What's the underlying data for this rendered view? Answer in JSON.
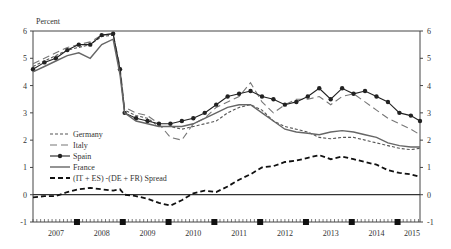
{
  "chart_data": {
    "type": "line",
    "title": "",
    "ylabel": "Percent",
    "xlabel": "",
    "ylim": [
      -1,
      6
    ],
    "yticks": [
      -1,
      0,
      1,
      2,
      3,
      4,
      5,
      6
    ],
    "xlim": [
      2007.0,
      2015.45
    ],
    "xtick_labels": [
      "2007",
      "2008",
      "2009",
      "2010",
      "2011",
      "2012",
      "2013",
      "2014",
      "2015"
    ],
    "year_end_markers": [
      2007.96,
      2008.96,
      2009.96,
      2010.96,
      2011.96,
      2012.96,
      2013.96,
      2014.96
    ],
    "grid": false,
    "legend_position": "left-middle",
    "x": [
      2007.0,
      2007.25,
      2007.5,
      2007.75,
      2008.0,
      2008.25,
      2008.5,
      2008.75,
      2008.9,
      2009.0,
      2009.25,
      2009.5,
      2009.75,
      2010.0,
      2010.25,
      2010.5,
      2010.75,
      2011.0,
      2011.25,
      2011.5,
      2011.75,
      2012.0,
      2012.25,
      2012.5,
      2012.75,
      2013.0,
      2013.25,
      2013.5,
      2013.75,
      2014.0,
      2014.25,
      2014.5,
      2014.75,
      2015.0,
      2015.25,
      2015.45
    ],
    "series": [
      {
        "name": "Germany",
        "style": "short-dash",
        "color": "#555555",
        "values": [
          4.7,
          4.9,
          5.1,
          5.3,
          5.4,
          5.5,
          5.8,
          5.85,
          4.5,
          3.1,
          2.9,
          2.8,
          2.5,
          2.5,
          2.4,
          2.5,
          2.6,
          2.7,
          3.0,
          3.2,
          3.3,
          3.1,
          2.7,
          2.5,
          2.4,
          2.3,
          2.1,
          2.05,
          2.1,
          2.1,
          2.0,
          1.9,
          1.8,
          1.7,
          1.65,
          1.7
        ]
      },
      {
        "name": "Italy",
        "style": "long-dash",
        "color": "#777777",
        "values": [
          4.8,
          5.0,
          5.2,
          5.4,
          5.5,
          5.6,
          5.85,
          5.9,
          4.7,
          3.2,
          3.0,
          2.9,
          2.6,
          2.1,
          2.0,
          2.6,
          2.8,
          3.2,
          3.4,
          3.6,
          4.1,
          3.4,
          3.0,
          3.3,
          3.5,
          3.5,
          3.6,
          3.3,
          3.6,
          3.7,
          3.4,
          3.1,
          2.8,
          2.6,
          2.4,
          2.2
        ]
      },
      {
        "name": "Spain",
        "style": "line-dot",
        "color": "#222222",
        "values": [
          4.6,
          4.85,
          5.0,
          5.3,
          5.5,
          5.5,
          5.85,
          5.9,
          4.6,
          3.0,
          2.8,
          2.7,
          2.6,
          2.6,
          2.7,
          2.8,
          3.0,
          3.3,
          3.6,
          3.7,
          3.8,
          3.6,
          3.5,
          3.3,
          3.4,
          3.6,
          3.9,
          3.5,
          3.9,
          3.7,
          3.8,
          3.6,
          3.4,
          3.0,
          2.9,
          2.7
        ]
      },
      {
        "name": "France",
        "style": "solid",
        "color": "#666666",
        "values": [
          4.5,
          4.7,
          4.9,
          5.1,
          5.2,
          5.0,
          5.5,
          5.7,
          4.4,
          3.0,
          2.7,
          2.6,
          2.5,
          2.5,
          2.5,
          2.6,
          2.8,
          3.0,
          3.2,
          3.3,
          3.3,
          3.0,
          2.7,
          2.4,
          2.3,
          2.25,
          2.2,
          2.3,
          2.35,
          2.3,
          2.2,
          2.1,
          1.9,
          1.8,
          1.75,
          1.75
        ]
      },
      {
        "name": "(IT + ES) -(DE + FR) Spread",
        "style": "bold-dash",
        "color": "#111111",
        "values": [
          -0.1,
          -0.05,
          -0.05,
          0.1,
          0.2,
          0.25,
          0.2,
          0.15,
          0.2,
          0.0,
          -0.05,
          -0.15,
          -0.3,
          -0.4,
          -0.2,
          0.05,
          0.15,
          0.1,
          0.3,
          0.55,
          0.75,
          1.0,
          1.05,
          1.2,
          1.25,
          1.35,
          1.45,
          1.3,
          1.4,
          1.3,
          1.2,
          1.1,
          0.9,
          0.8,
          0.75,
          0.65
        ]
      }
    ]
  },
  "labels": {
    "y_unit": "Percent",
    "legend": [
      "Germany",
      "Italy",
      "Spain",
      "France",
      "(IT + ES) -(DE + FR) Spread"
    ]
  }
}
